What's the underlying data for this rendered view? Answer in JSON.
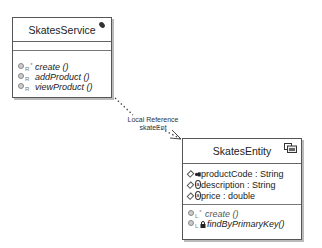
{
  "classes": {
    "service": {
      "name": "SkatesService",
      "icon": "pencil-note-icon",
      "attributes": [],
      "operations": [
        {
          "marker": "R",
          "star": "*",
          "name": "create ()"
        },
        {
          "marker": "R",
          "star": "",
          "name": "addProduct ()"
        },
        {
          "marker": "R",
          "star": "",
          "name": "viewProduct ()"
        }
      ]
    },
    "entity": {
      "name": "SkatesEntity",
      "icon": "entity-bean-icon",
      "attributes": [
        {
          "marker": "key",
          "text": "productCode : String"
        },
        {
          "marker": "a",
          "text": "description : String"
        },
        {
          "marker": "a",
          "text": "price : double"
        }
      ],
      "operations": [
        {
          "marker": "L",
          "star": "*",
          "name": "create ()",
          "lock": false
        },
        {
          "marker": "L",
          "star": "",
          "name": "findByPrimaryKey()",
          "lock": true
        }
      ]
    }
  },
  "relationship": {
    "type": "Local Reference",
    "role": "skateEnt",
    "style": "dotted-arrow"
  }
}
